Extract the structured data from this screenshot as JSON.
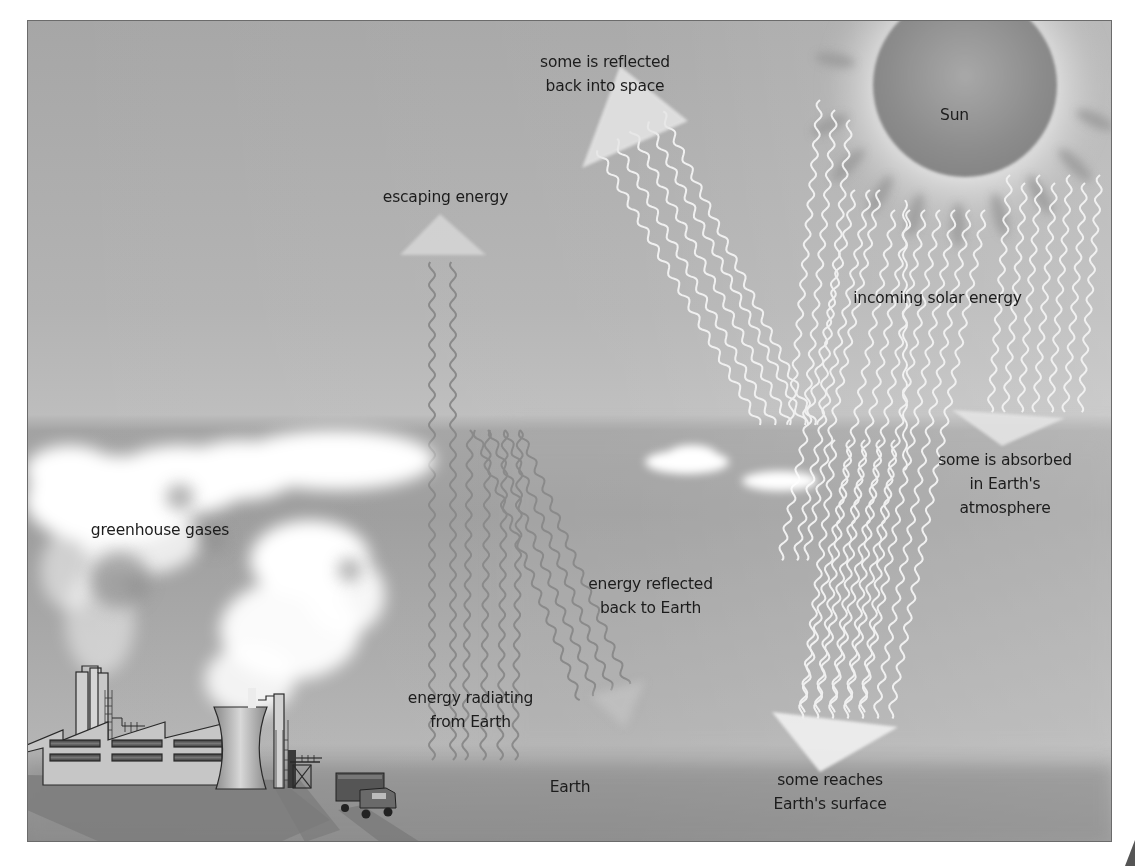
{
  "diagram": {
    "type": "greenhouse-effect",
    "colors": {
      "sky_top": "#a9a9a9",
      "sky_mid": "#b8b8b8",
      "atmosphere_band": "#9e9e9e",
      "ground": "#8f8f8f",
      "sun": "#8e8e8e",
      "solar_ray": "#f4f4f4",
      "earth_ray": "#8c8c8c",
      "cloud": "#ffffff",
      "text": "#1c1c1c",
      "border": "#6a6a6a"
    },
    "labels": {
      "sun": "Sun",
      "reflected_space": [
        "some is reflected",
        "back into space"
      ],
      "escaping": "escaping energy",
      "incoming": "incoming solar energy",
      "absorbed": [
        "some is absorbed",
        "in Earth's",
        "atmosphere"
      ],
      "greenhouse": "greenhouse gases",
      "reflected_earth": [
        "energy reflected",
        "back to Earth"
      ],
      "radiating": [
        "energy radiating",
        "from Earth"
      ],
      "earth": "Earth",
      "reaches": [
        "some reaches",
        "Earth's surface"
      ]
    },
    "elements": {
      "sun_icon": "sun",
      "factory_icon": "factory-with-cooling-tower",
      "truck_icon": "truck",
      "cloud_icon": "cloud"
    }
  }
}
